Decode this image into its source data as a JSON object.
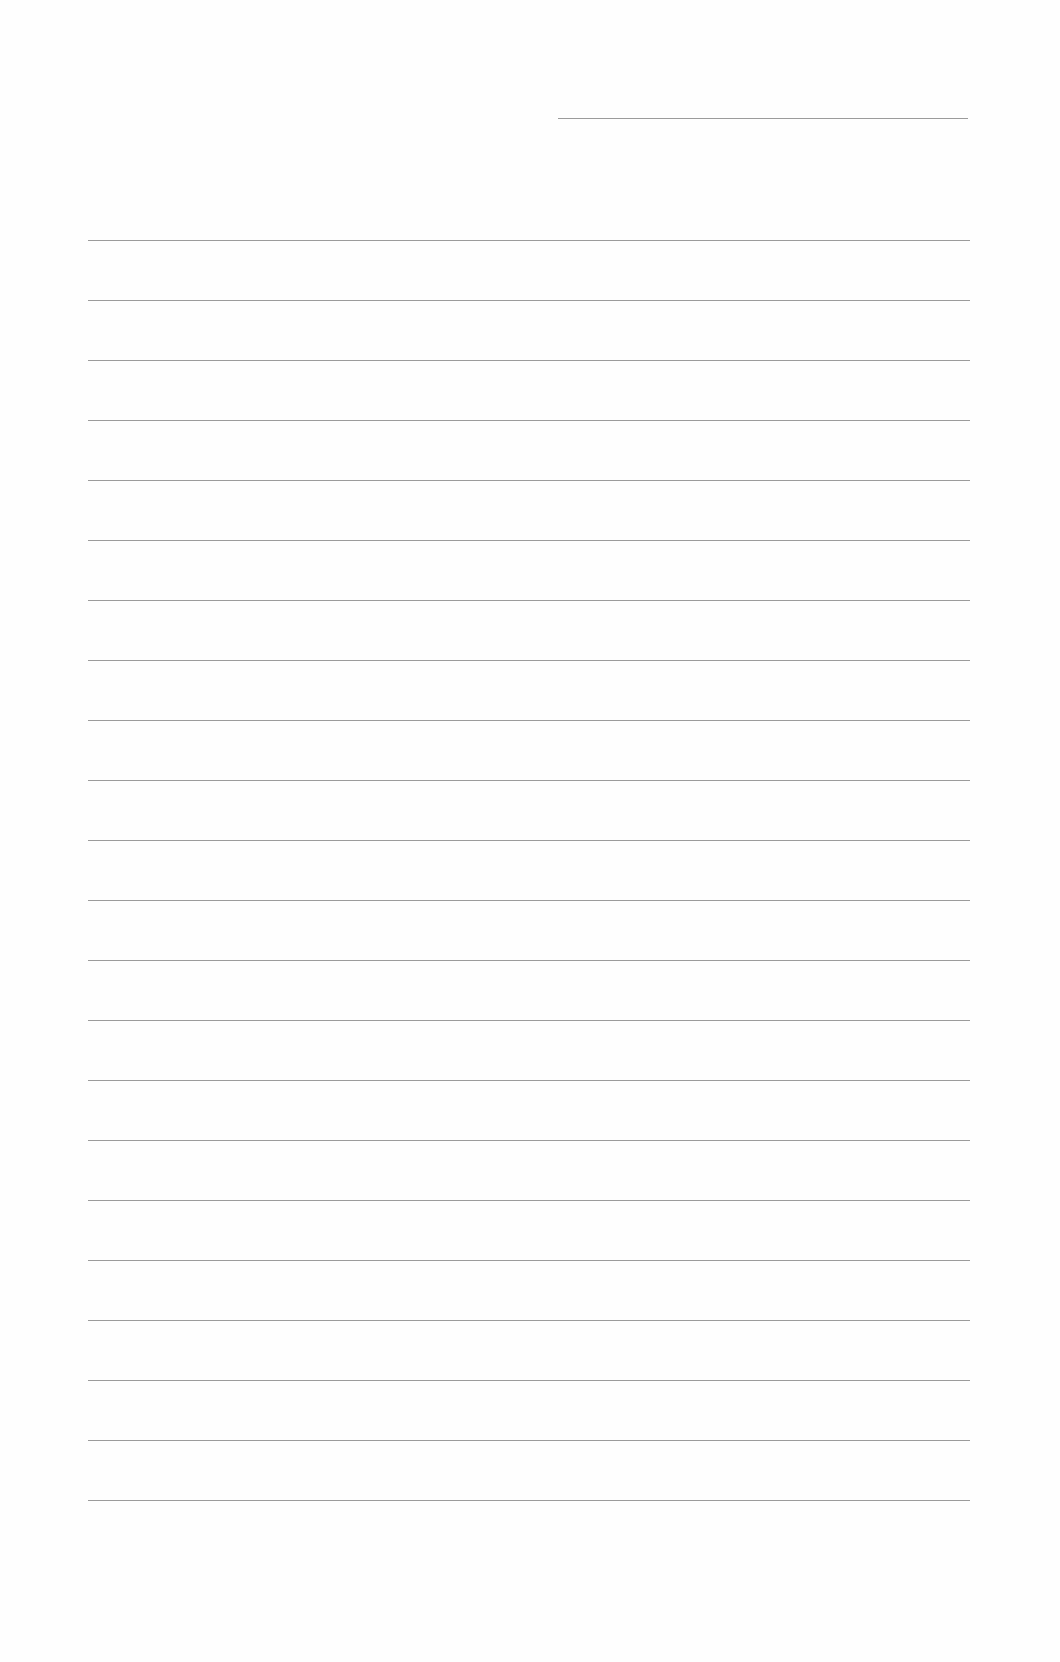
{
  "page": {
    "type": "lined-paper",
    "background": "#fefefe",
    "line_color": "#8a8a8a",
    "header_line": {
      "x1": 558,
      "x2": 968,
      "y": 118
    },
    "ruled_lines": {
      "count": 22,
      "x1": 88,
      "x2": 970,
      "y_start": 240,
      "spacing": 60
    },
    "text": []
  }
}
